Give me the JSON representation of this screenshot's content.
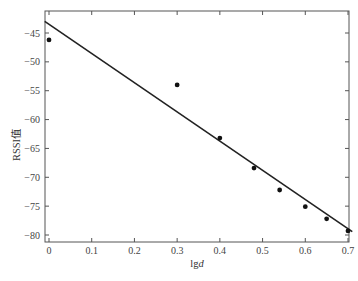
{
  "chart_data": {
    "type": "scatter",
    "title": "",
    "xlabel": "lgd",
    "ylabel": "RSSI值",
    "xlim": [
      0,
      0.7
    ],
    "ylim": [
      -81,
      -42
    ],
    "xticks": [
      "0",
      "0.1",
      "0.2",
      "0.3",
      "0.4",
      "0.5",
      "0.6",
      "0.7"
    ],
    "yticks": [
      "-45",
      "-50",
      "-55",
      "-60",
      "-65",
      "-70",
      "-75",
      "-80"
    ],
    "grid": false,
    "legend": null,
    "series": [
      {
        "name": "measured",
        "kind": "scatter",
        "x": [
          0,
          0.3,
          0.4,
          0.48,
          0.54,
          0.6,
          0.65,
          0.7
        ],
        "y": [
          -46.2,
          -54.0,
          -63.2,
          -68.4,
          -72.2,
          -75.1,
          -77.2,
          -79.3
        ]
      },
      {
        "name": "fit",
        "kind": "line",
        "x": [
          -0.01,
          0.71
        ],
        "y": [
          -43.0,
          -79.4
        ]
      }
    ]
  }
}
